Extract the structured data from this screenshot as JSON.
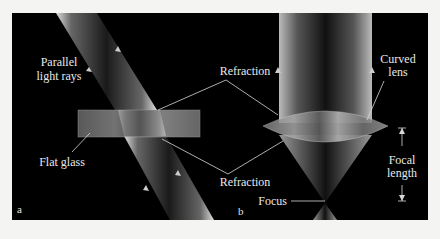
{
  "figure": {
    "panel_a": {
      "letter": "a",
      "labels": {
        "parallel_line1": "Parallel",
        "parallel_line2": "light rays",
        "refraction_top": "Refraction",
        "flat_glass": "Flat glass",
        "refraction_bottom": "Refraction"
      }
    },
    "panel_b": {
      "letter": "b",
      "labels": {
        "curved_line1": "Curved",
        "curved_line2": "lens",
        "focal_line1": "Focal",
        "focal_line2": "length",
        "focus": "Focus"
      }
    },
    "colors": {
      "background": "#000000",
      "page": "#f4f4f2",
      "text": "#e8e8e8"
    }
  }
}
